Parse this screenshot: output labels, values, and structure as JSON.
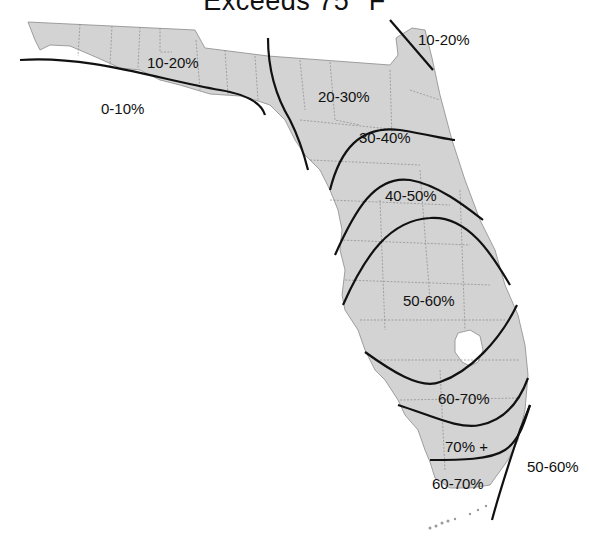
{
  "title": "Exceeds 75° F",
  "map": {
    "region": "Florida",
    "fill_color": "#d3d3d3",
    "county_line_color": "#7a7a7a",
    "isoline_color": "#111111"
  },
  "zones": [
    {
      "id": "ne-coast",
      "label": "10-20%"
    },
    {
      "id": "panhandle-north",
      "label": "10-20%"
    },
    {
      "id": "panhandle-south",
      "label": "0-10%"
    },
    {
      "id": "north-central",
      "label": "20-30%"
    },
    {
      "id": "north-east",
      "label": "30-40%"
    },
    {
      "id": "central",
      "label": "40-50%"
    },
    {
      "id": "south-central",
      "label": "50-60%"
    },
    {
      "id": "south",
      "label": "60-70%"
    },
    {
      "id": "southmost",
      "label": "70% +"
    },
    {
      "id": "keys",
      "label": "60-70%"
    },
    {
      "id": "atlantic",
      "label": "50-60%"
    }
  ]
}
